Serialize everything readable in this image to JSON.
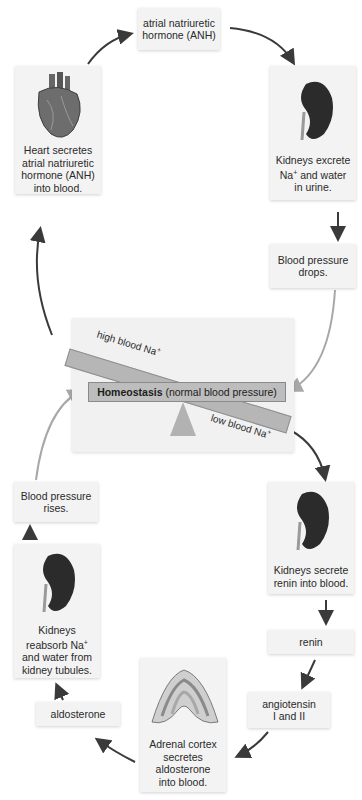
{
  "diagram": {
    "type": "negative-feedback-cycle",
    "colors": {
      "box_bg": "#f3f3f3",
      "panel_bg": "#f1f1f1",
      "beam": "#b6b6b6",
      "arrow_dark": "#3a3a3a",
      "arrow_light": "#a8a8a8",
      "kidney": "#2b2b2b"
    },
    "nodes": {
      "anh": {
        "line1": "atrial natriuretic",
        "line2": "hormone (ANH)"
      },
      "heart": {
        "icon": "heart-icon",
        "line1": "Heart secretes",
        "line2": "atrial natriuretic",
        "line3": "hormone (ANH)",
        "line4": "into blood."
      },
      "kidney_excrete": {
        "icon": "kidney-icon",
        "line1": "Kidneys excrete",
        "line2": "Na",
        "line2_sup": "+",
        "line2_rest": " and water",
        "line3": "in urine."
      },
      "bp_drops": {
        "line1": "Blood pressure",
        "line2": "drops."
      },
      "bp_rises": {
        "line1": "Blood pressure",
        "line2": "rises."
      },
      "kidney_renin": {
        "icon": "kidney-icon",
        "line1": "Kidneys secrete",
        "line2": "renin into blood."
      },
      "renin": {
        "line1": "renin"
      },
      "angiotensin": {
        "line1": "angiotensin",
        "line2": "I and II"
      },
      "adrenal": {
        "icon": "adrenal-gland-icon",
        "line1": "Adrenal cortex",
        "line2": "secretes",
        "line3": "aldosterone",
        "line4": "into blood."
      },
      "aldosterone": {
        "line1": "aldosterone"
      },
      "kidney_reabsorb": {
        "icon": "kidney-icon",
        "line1": "Kidneys",
        "line2": "reabsorb Na",
        "line2_sup": "+",
        "line3": "and water from",
        "line4": "kidney tubules."
      }
    },
    "center": {
      "homeostasis_bold": "Homeostasis",
      "homeostasis_rest": " (normal blood pressure)",
      "high_label": "high blood Na",
      "low_label": "low blood Na",
      "sup": "+"
    }
  }
}
